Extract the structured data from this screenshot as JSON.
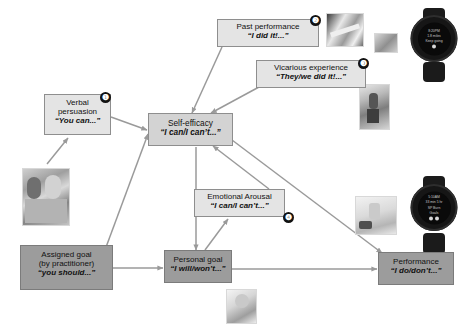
{
  "diagram": {
    "colors": {
      "light_box": "#e4e4e4",
      "dark_box": "#9c9c9c",
      "arrow": "#9a9a9a",
      "badge": "#111111",
      "background": "#ffffff"
    },
    "nodes": [
      {
        "id": "verbal-persuasion",
        "line1": "Verbal",
        "line2": "persuasion",
        "quote": "“You can...”",
        "style": "light",
        "badge": "❶"
      },
      {
        "id": "past-performance",
        "line1": "Past performance",
        "quote": "“I did it!...”",
        "style": "light",
        "badge": "❷"
      },
      {
        "id": "vicarious-experience",
        "line1": "Vicarious experience",
        "quote": "“They/we did it!...”",
        "style": "light",
        "badge": "❸"
      },
      {
        "id": "self-efficacy",
        "line1": "Self-efficacy",
        "quote": "“I can/I can’t...”",
        "style": "light",
        "badge": ""
      },
      {
        "id": "emotional-arousal",
        "line1": "Emotional Arousal",
        "quote": "“I can/I can’t...”",
        "style": "light",
        "badge": "❹"
      },
      {
        "id": "assigned-goal",
        "line1": "Assigned goal",
        "line2": "(by practitioner)",
        "quote": "“you should...”",
        "style": "dark",
        "badge": ""
      },
      {
        "id": "personal-goal",
        "line1": "Personal goal",
        "quote": "“I will/won’t...”",
        "style": "dark",
        "badge": ""
      },
      {
        "id": "performance",
        "line1": "Performance",
        "quote": "“I do/don’t...”",
        "style": "dark",
        "badge": ""
      }
    ],
    "badges": {
      "one": "❶",
      "two": "❷",
      "three": "❸",
      "four": "❹"
    },
    "edges": [
      {
        "from": "verbal-persuasion",
        "to": "self-efficacy"
      },
      {
        "from": "past-performance",
        "to": "self-efficacy"
      },
      {
        "from": "vicarious-experience",
        "to": "self-efficacy"
      },
      {
        "from": "emotional-arousal",
        "to": "self-efficacy"
      },
      {
        "from": "assigned-goal",
        "to": "self-efficacy"
      },
      {
        "from": "assigned-goal",
        "to": "personal-goal"
      },
      {
        "from": "self-efficacy",
        "to": "personal-goal"
      },
      {
        "from": "self-efficacy",
        "to": "performance"
      },
      {
        "from": "personal-goal",
        "to": "performance"
      },
      {
        "from": "personal-goal",
        "to": "emotional-arousal"
      },
      {
        "from": "practitioner-photo",
        "to": "verbal-persuasion"
      }
    ],
    "photos": [
      {
        "id": "practitioner-client-photo",
        "caption": "practitioner and client"
      },
      {
        "id": "past-performance-photo-large",
        "caption": "activity photo"
      },
      {
        "id": "past-performance-photo-small",
        "caption": "activity photo"
      },
      {
        "id": "vicarious-experience-photo",
        "caption": "person walking"
      },
      {
        "id": "emotional-arousal-photo",
        "caption": "relaxation items"
      },
      {
        "id": "personal-goal-photo",
        "caption": "smiling person"
      }
    ],
    "watches": [
      {
        "id": "smartwatch-top",
        "screen_lines": [
          "8:20PM",
          "1.8 miles",
          "Keep going"
        ]
      },
      {
        "id": "smartwatch-bottom",
        "screen_lines": [
          "5:10AM",
          "33 min 5 hr",
          "SP Burn",
          "Goals"
        ]
      }
    ]
  }
}
